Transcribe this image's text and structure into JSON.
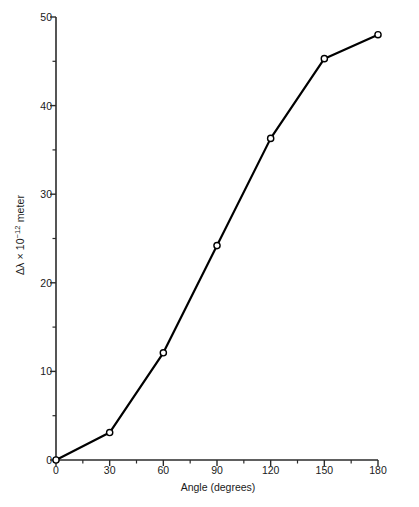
{
  "chart_data": {
    "type": "line",
    "title": "",
    "subtitle": "",
    "xlabel": "Angle (degrees)",
    "ylabel": "Δλ × 10−12 meter",
    "ylabel_base": "Δλ × 10",
    "ylabel_exponent": "−12",
    "ylabel_unit": " meter",
    "x": [
      0,
      30,
      60,
      90,
      120,
      150,
      180
    ],
    "values": [
      0.0,
      3.1,
      12.1,
      24.2,
      36.3,
      45.3,
      48.0
    ],
    "series": [
      {
        "name": "Compton wavelength shift",
        "x": [
          0,
          30,
          60,
          90,
          120,
          150,
          180
        ],
        "values": [
          0.0,
          3.1,
          12.1,
          24.2,
          36.3,
          45.3,
          48.0
        ]
      }
    ],
    "xlim": [
      0,
      180
    ],
    "ylim": [
      0,
      50
    ],
    "x_major_ticks": [
      0,
      30,
      60,
      90,
      120,
      150,
      180
    ],
    "x_major_tick_labels": [
      "0",
      "30",
      "60",
      "90",
      "120",
      "150",
      "180"
    ],
    "x_minor_ticks": [
      15,
      45,
      75,
      105,
      135,
      165
    ],
    "y_major_ticks": [
      0,
      10,
      20,
      30,
      40,
      50
    ],
    "y_major_tick_labels": [
      "0",
      "10",
      "20",
      "30",
      "40",
      "50"
    ],
    "y_minor_ticks": [
      5,
      15,
      25,
      35,
      45
    ],
    "grid": false,
    "legend": null,
    "legend_position": "none",
    "annotations": [],
    "marker": "open-circle",
    "marker_size": 5,
    "line_color": "#000000",
    "line_width": 2.2,
    "marker_fill": "#ffffff",
    "marker_stroke": "#000000",
    "axis_color": "#2b2b2b",
    "tick_direction": "out",
    "spines": [
      "left",
      "bottom"
    ]
  }
}
